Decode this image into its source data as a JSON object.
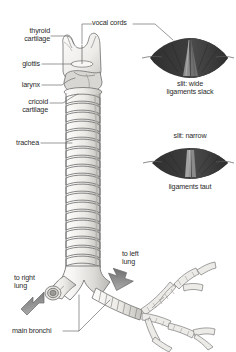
{
  "figure": {
    "background": "#ffffff",
    "line_color": "#6f6f6f",
    "text_color": "#2b2b2b",
    "cartilage_fill": "#f2f1ef",
    "cartilage_shade": "#c9c7c3",
    "inset_dark": "#3b3b3b",
    "inset_mid": "#636363",
    "inset_light": "#9a9a9a",
    "arrow_fill": "#8d8d8d"
  },
  "labels": {
    "thyroid_cartilage": "thyroid\ncartilage",
    "vocal_cords": "vocal cords",
    "glottis": "glottis",
    "larynx": "larynx",
    "cricoid_cartilage": "cricoid\ncartilage",
    "trachea": "trachea",
    "to_right_lung": "to right\nlung",
    "to_left_lung": "to left\nlung",
    "main_bronchi": "main bronchi"
  },
  "insets": [
    {
      "id": "wide",
      "caption_above": "",
      "caption_below": "slit: wide\nligaments slack",
      "state": "open"
    },
    {
      "id": "narrow",
      "caption_above": "slit: narrow",
      "caption_below": "ligaments taut",
      "state": "closed"
    }
  ]
}
